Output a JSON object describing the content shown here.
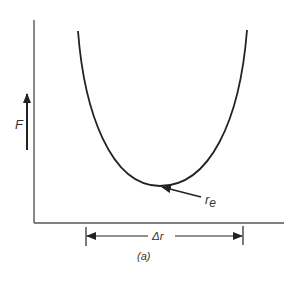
{
  "figure": {
    "caption": "(a)",
    "y_axis_label": "F",
    "min_point_label_main": "r",
    "min_point_label_sub": "e",
    "span_label": "Δr",
    "colors": {
      "line": "#222222",
      "axis": "#555555",
      "text": "#333333",
      "background": "#ffffff"
    }
  }
}
